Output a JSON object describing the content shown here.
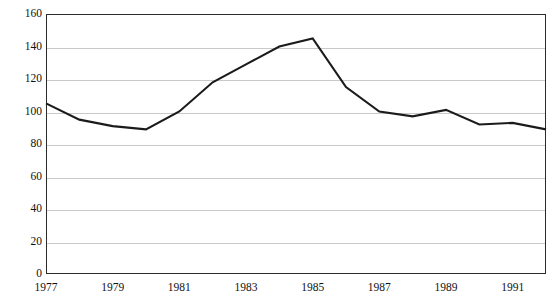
{
  "chart_data": {
    "type": "line",
    "title": "",
    "subtitle": "",
    "xlabel": "",
    "ylabel": "",
    "x": [
      1977,
      1978,
      1979,
      1980,
      1981,
      1982,
      1983,
      1984,
      1985,
      1986,
      1987,
      1988,
      1989,
      1990,
      1991,
      1992
    ],
    "series": [
      {
        "name": "Index",
        "values": [
          105,
          95,
          91,
          89,
          100,
          118,
          129,
          140,
          145,
          115,
          100,
          97,
          101,
          92,
          93,
          89
        ]
      }
    ],
    "xlim": [
      1977,
      1992
    ],
    "ylim": [
      0,
      160
    ],
    "ytick_labels": [
      "0",
      "20",
      "40",
      "60",
      "80",
      "100",
      "120",
      "140",
      "160"
    ],
    "ytick_values": [
      0,
      20,
      40,
      60,
      80,
      100,
      120,
      140,
      160
    ],
    "xtick_labels": [
      "1977",
      "1979",
      "1981",
      "1983",
      "1985",
      "1987",
      "1989",
      "1991"
    ],
    "xtick_values": [
      1977,
      1979,
      1981,
      1983,
      1985,
      1987,
      1989,
      1991
    ],
    "grid": "horizontal",
    "legend": "none",
    "colors": {
      "line": "#1b1b1b",
      "grid": "#c9c9c9",
      "frame": "#2b2b2b",
      "background": "#ffffff",
      "text": "#111111"
    },
    "annotations": []
  }
}
